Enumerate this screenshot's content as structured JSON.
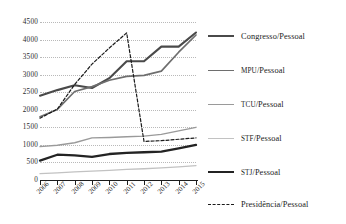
{
  "chart_data": {
    "type": "line",
    "title": "",
    "subtitle": "",
    "xlabel": "",
    "ylabel": "",
    "x": [
      "2006",
      "2007",
      "2008",
      "2009",
      "2010",
      "2011",
      "2012",
      "2013",
      "2014",
      "2015"
    ],
    "ylim": [
      0,
      4500
    ],
    "ytick_values": [
      0,
      500,
      1000,
      1500,
      2000,
      2500,
      3000,
      3500,
      4000,
      4500
    ],
    "ytick_labels": [
      "0",
      "500",
      "1000",
      "1500",
      "2000",
      "2500",
      "3000",
      "3500",
      "4000",
      "4500"
    ],
    "grid": true,
    "legend_position": "right",
    "series": [
      {
        "name": "Congresso/Pessoal",
        "color": "#4a4a4a",
        "width": 2.1,
        "dash": "none",
        "values": [
          2400,
          2560,
          2700,
          2620,
          2900,
          3380,
          3380,
          3800,
          3800,
          4200
        ]
      },
      {
        "name": "MPU/Pessoal",
        "color": "#6e6e6e",
        "width": 1.7,
        "dash": "none",
        "values": [
          1800,
          2010,
          2520,
          2660,
          2840,
          2950,
          2980,
          3100,
          3640,
          4130
        ]
      },
      {
        "name": "TCU/Pessoal",
        "color": "#9a9a9a",
        "width": 1.4,
        "dash": "none",
        "values": [
          950,
          990,
          1060,
          1200,
          1210,
          1230,
          1250,
          1300,
          1400,
          1500
        ]
      },
      {
        "name": "STF/Pessoal",
        "color": "#c2c2c2",
        "width": 1.3,
        "dash": "none",
        "values": [
          180,
          205,
          230,
          255,
          275,
          300,
          320,
          345,
          375,
          410
        ]
      },
      {
        "name": "STJ/Pessoal",
        "color": "#232323",
        "width": 2.3,
        "dash": "none",
        "values": [
          550,
          720,
          700,
          660,
          740,
          770,
          790,
          810,
          900,
          1000
        ]
      },
      {
        "name": "Presidência/Pessoal",
        "color": "#1a1a1a",
        "width": 1.2,
        "dash": "3 2",
        "values": [
          1760,
          2020,
          2720,
          3300,
          3760,
          4190,
          1100,
          1120,
          1160,
          1200
        ]
      }
    ]
  },
  "legend": {
    "items": [
      {
        "label": "Congresso/Pessoal",
        "smallcaps": ""
      },
      {
        "label": "MPU/Pessoal",
        "smallcaps": "MPU"
      },
      {
        "label": "TCU/Pessoal",
        "smallcaps": "TCU"
      },
      {
        "label": "STF/Pessoal",
        "smallcaps": "STF"
      },
      {
        "label": "STJ/Pessoal",
        "smallcaps": "STJ"
      },
      {
        "label": "Presidência/Pessoal",
        "smallcaps": ""
      }
    ]
  }
}
